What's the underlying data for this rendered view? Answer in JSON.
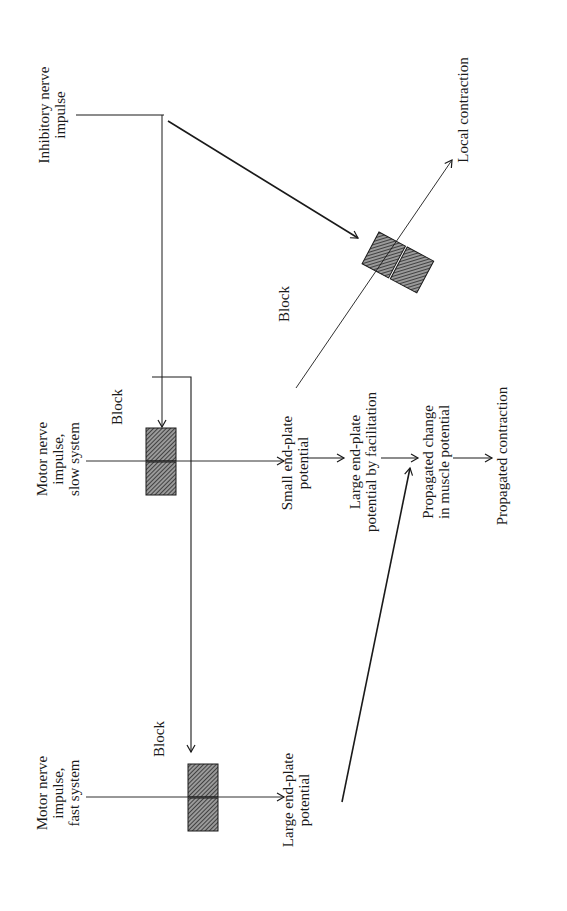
{
  "diagram": {
    "orientation": "rotated -90deg",
    "labels": {
      "inhibitory": [
        "Inhibitory nerve",
        "impulse"
      ],
      "motor_slow": [
        "Motor nerve",
        "impulse,",
        "slow system"
      ],
      "motor_fast": [
        "Motor nerve",
        "impulse,",
        "fast system"
      ],
      "block_top": "Block",
      "block_slow": "Block",
      "block_fast": "Block",
      "local_contraction": "Local contraction",
      "small_epp": [
        "Small end-plate",
        "potential"
      ],
      "large_epp_facilitation": [
        "Large end-plate",
        "potential by facilitation"
      ],
      "propagated_change": [
        "Propagated change",
        "in muscle potential"
      ],
      "propagated_contraction": "Propagated contraction",
      "large_epp_fast": [
        "Large end-plate",
        "potential"
      ]
    },
    "colors": {
      "ink": "#1a1a1a",
      "block_fill": "#555555",
      "background": "#ffffff"
    }
  }
}
